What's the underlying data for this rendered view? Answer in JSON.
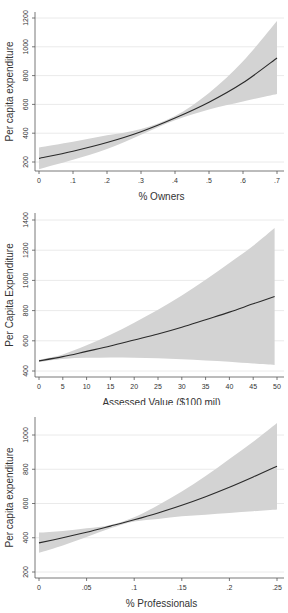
{
  "chart_data": [
    {
      "type": "line",
      "title": "",
      "xlabel": "% Owners",
      "ylabel": "Per capita expenditure",
      "xlim": [
        0,
        0.7
      ],
      "ylim": [
        150,
        1250
      ],
      "x_ticks": [
        0,
        0.1,
        0.2,
        0.3,
        0.4,
        0.5,
        0.6,
        0.7
      ],
      "x_tick_labels": [
        "0",
        ".1",
        ".2",
        ".3",
        ".4",
        ".5",
        ".6",
        ".7"
      ],
      "y_ticks": [
        200,
        400,
        600,
        800,
        1000,
        1200
      ],
      "y_tick_labels": [
        "200",
        "400",
        "600",
        "800",
        "1000",
        "1200"
      ],
      "grid": true,
      "x": [
        0,
        0.1,
        0.2,
        0.3,
        0.4,
        0.5,
        0.6,
        0.7
      ],
      "series": [
        {
          "name": "Predicted",
          "values": [
            225,
            275,
            335,
            410,
            505,
            615,
            750,
            922
          ]
        },
        {
          "name": "Upper CI",
          "values": [
            300,
            340,
            385,
            430,
            520,
            680,
            900,
            1180
          ]
        },
        {
          "name": "Lower CI",
          "values": [
            150,
            215,
            290,
            390,
            490,
            565,
            620,
            672
          ]
        }
      ],
      "layout": {
        "top": 0,
        "height": 205,
        "x0": 39,
        "x1": 277,
        "y_val0": 200,
        "y_px0": 162,
        "y_val1": 1200,
        "y_px1": 18,
        "axis_bottom": 171,
        "axis_top": 12
      }
    },
    {
      "type": "line",
      "title": "",
      "xlabel": "Assessed Value ($100 mil)",
      "ylabel": "Per Capita Expenditure",
      "xlim": [
        0,
        50
      ],
      "ylim": [
        380,
        1420
      ],
      "x_ticks": [
        0,
        5,
        10,
        15,
        20,
        25,
        30,
        35,
        40,
        45,
        50
      ],
      "x_tick_labels": [
        "0",
        "5",
        "10",
        "15",
        "20",
        "25",
        "30",
        "35",
        "40",
        "45",
        "50"
      ],
      "y_ticks": [
        400,
        600,
        800,
        1000,
        1200,
        1400
      ],
      "y_tick_labels": [
        "400",
        "600",
        "800",
        "1000",
        "1200",
        "1400"
      ],
      "grid": true,
      "x": [
        0,
        5,
        10,
        15,
        20,
        25,
        30,
        35,
        40,
        45,
        49.5
      ],
      "series": [
        {
          "name": "Predicted",
          "values": [
            467,
            495,
            530,
            565,
            605,
            645,
            690,
            740,
            790,
            845,
            893
          ]
        },
        {
          "name": "Upper CI",
          "values": [
            475,
            510,
            570,
            640,
            720,
            805,
            900,
            1005,
            1115,
            1230,
            1347
          ]
        },
        {
          "name": "Lower CI",
          "values": [
            460,
            480,
            487,
            490,
            488,
            485,
            478,
            470,
            462,
            450,
            440
          ]
        }
      ],
      "layout": {
        "top": 200,
        "height": 205,
        "x0": 39,
        "x1": 277,
        "y_val0": 400,
        "y_px0": 171,
        "y_val1": 1400,
        "y_px1": 20,
        "axis_bottom": 177,
        "axis_top": 13
      }
    },
    {
      "type": "line",
      "title": "",
      "xlabel": "% Professionals",
      "ylabel": "Per capita expenditure",
      "xlim": [
        0,
        0.25
      ],
      "ylim": [
        180,
        1100
      ],
      "x_ticks": [
        0,
        0.05,
        0.1,
        0.15,
        0.2,
        0.25
      ],
      "x_tick_labels": [
        "0",
        ".05",
        ".1",
        ".15",
        ".2",
        ".25"
      ],
      "y_ticks": [
        200,
        400,
        600,
        800,
        1000
      ],
      "y_tick_labels": [
        "200",
        "400",
        "600",
        "800",
        "1000"
      ],
      "grid": true,
      "x": [
        0,
        0.025,
        0.05,
        0.075,
        0.1,
        0.125,
        0.15,
        0.175,
        0.2,
        0.225,
        0.25
      ],
      "series": [
        {
          "name": "Predicted",
          "values": [
            370,
            400,
            432,
            468,
            505,
            545,
            590,
            640,
            695,
            755,
            818
          ]
        },
        {
          "name": "Upper CI",
          "values": [
            430,
            440,
            455,
            475,
            520,
            590,
            670,
            760,
            860,
            960,
            1070
          ]
        },
        {
          "name": "Lower CI",
          "values": [
            312,
            355,
            405,
            455,
            495,
            510,
            525,
            535,
            545,
            555,
            565
          ]
        }
      ],
      "layout": {
        "top": 405,
        "height": 208,
        "x0": 39,
        "x1": 277,
        "y_val0": 200,
        "y_px0": 167,
        "y_val1": 1000,
        "y_px1": 30,
        "axis_bottom": 173,
        "axis_top": 12
      }
    }
  ],
  "colors": {
    "band": "#d3d3d3",
    "line": "#2a2a2a",
    "grid": "#eaeaea",
    "axis": "#555555"
  }
}
